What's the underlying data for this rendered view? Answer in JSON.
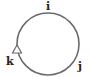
{
  "diagram": {
    "labels": {
      "top": "i",
      "bottom_right": "j",
      "bottom_left": "k"
    },
    "circle": {
      "cx": 48,
      "cy": 44,
      "r": 31,
      "stroke": "#6b6b6b"
    },
    "arrow": {
      "direction": "up",
      "style": "open-triangle",
      "position": "left"
    }
  }
}
